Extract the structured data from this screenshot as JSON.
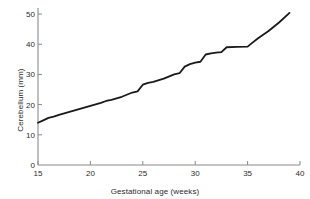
{
  "chart_data": {
    "type": "line",
    "title": "",
    "xlabel": "Gestational age (weeks)",
    "ylabel": "Cerebellum (mm)",
    "xlim": [
      15,
      40
    ],
    "ylim": [
      0,
      52
    ],
    "xticks": [
      15,
      20,
      25,
      30,
      35,
      40
    ],
    "xtick_labels": [
      "15",
      "20",
      "25",
      "30",
      "35",
      "40"
    ],
    "yticks": [
      0,
      10,
      20,
      30,
      40,
      50
    ],
    "ytick_labels": [
      "0",
      "10",
      "20",
      "30",
      "40",
      "50"
    ],
    "grid": false,
    "legend": null,
    "line_color": "#1a1a1a",
    "line_width": 1.8,
    "axis_color": "#8a8a8a",
    "background_color": "#ffffff",
    "series": [
      {
        "name": "Cerebellum diameter",
        "x": [
          15,
          15.5,
          16,
          16.5,
          17,
          18,
          19,
          20,
          21,
          21.5,
          22,
          23,
          24,
          24.5,
          25,
          25.5,
          26,
          27,
          28,
          28.5,
          29,
          29.5,
          30,
          30.5,
          31,
          31.5,
          32,
          32.5,
          33,
          34,
          35,
          35.5,
          36,
          37,
          38,
          39
        ],
        "y": [
          14.0,
          14.8,
          15.6,
          16.0,
          16.6,
          17.6,
          18.6,
          19.6,
          20.6,
          21.2,
          21.6,
          22.6,
          24.0,
          24.4,
          26.6,
          27.2,
          27.5,
          28.6,
          30.0,
          30.4,
          32.6,
          33.4,
          33.9,
          34.2,
          36.6,
          37.0,
          37.2,
          37.4,
          39.0,
          39.1,
          39.2,
          40.6,
          42.0,
          44.4,
          47.2,
          50.4
        ]
      }
    ]
  }
}
